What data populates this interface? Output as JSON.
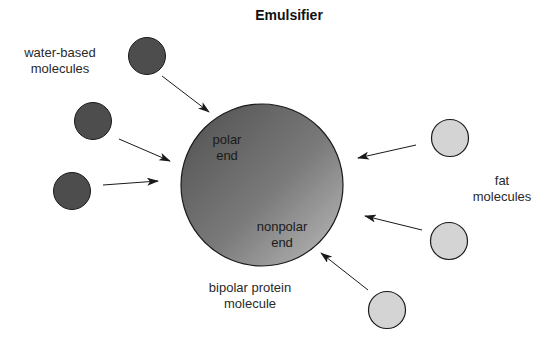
{
  "title": "Emulsifier",
  "labels": {
    "water_based": [
      "water-based",
      "molecules"
    ],
    "fat": [
      "fat",
      "molecules"
    ],
    "protein": [
      "bipolar protein",
      "molecule"
    ],
    "polar_end": [
      "polar",
      "end"
    ],
    "nonpolar_end": [
      "nonpolar",
      "end"
    ]
  },
  "colors": {
    "water_molecule": "#4d4d4d",
    "fat_molecule": "#d4d4d4",
    "protein_gradient_dark": "#4f4f4f",
    "protein_gradient_light": "#b8b8b8",
    "outline": "#1a1a1a",
    "arrow": "#1a1a1a"
  },
  "diagram": {
    "protein": {
      "cx": 262,
      "cy": 185,
      "r": 81
    },
    "water_molecules": [
      {
        "cx": 147,
        "cy": 56,
        "r": 18.5
      },
      {
        "cx": 93,
        "cy": 121,
        "r": 18.5
      },
      {
        "cx": 72,
        "cy": 191,
        "r": 18.5
      }
    ],
    "fat_molecules": [
      {
        "cx": 450,
        "cy": 138,
        "r": 18.5
      },
      {
        "cx": 449,
        "cy": 241,
        "r": 18.5
      },
      {
        "cx": 387,
        "cy": 310,
        "r": 18.5
      }
    ],
    "arrows": [
      {
        "from": "water-1",
        "x1": 162,
        "y1": 76,
        "x2": 209,
        "y2": 112
      },
      {
        "from": "water-2",
        "x1": 119,
        "y1": 139,
        "x2": 170,
        "y2": 161
      },
      {
        "from": "water-3",
        "x1": 103,
        "y1": 185,
        "x2": 158,
        "y2": 181
      },
      {
        "from": "fat-1",
        "x1": 416,
        "y1": 145,
        "x2": 358,
        "y2": 158
      },
      {
        "from": "fat-2",
        "x1": 422,
        "y1": 230,
        "x2": 365,
        "y2": 216
      },
      {
        "from": "fat-3",
        "x1": 368,
        "y1": 290,
        "x2": 321,
        "y2": 253
      }
    ]
  }
}
